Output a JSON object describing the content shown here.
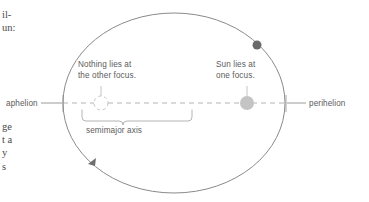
{
  "figure": {
    "background_color": "#ffffff",
    "ellipse_stroke": "#8a8a8a",
    "axis_color": "#b0b0b0",
    "label_color": "#5c5c5c",
    "sun_color": "#bdbdbd",
    "planet_color": "#6e6e6e"
  },
  "labels": {
    "nothing_focus_line1": "Nothing lies at",
    "nothing_focus_line2": "the other focus.",
    "sun_focus_line1": "Sun lies at",
    "sun_focus_line2": "one focus.",
    "semimajor_axis": "semimajor axis",
    "aphelion": "aphelion",
    "perihelion": "perihelion"
  },
  "body_text_fragments": {
    "top_line1": "il-",
    "top_line2": "un:",
    "bottom_line1": "ge",
    "bottom_line2": "t a",
    "bottom_line3": "y",
    "bottom_line4": "s"
  },
  "markers": {
    "empty_focus": "open-circle",
    "sun": "filled-circle",
    "planet": "filled-dot",
    "direction_arrow": "arrowhead"
  },
  "geometry": {
    "ellipse_center_x": 174,
    "ellipse_center_y": 103,
    "ellipse_rx": 111,
    "ellipse_ry": 90,
    "empty_focus_x": 101,
    "sun_focus_x": 247,
    "focus_y": 103,
    "planet_x": 257,
    "planet_y": 45
  }
}
